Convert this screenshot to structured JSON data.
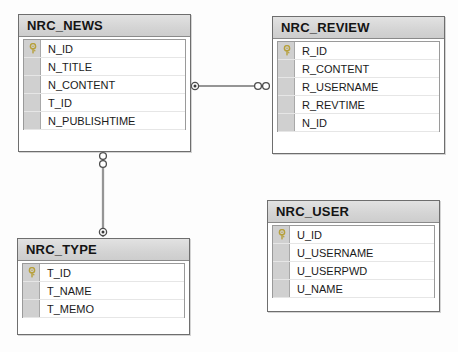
{
  "diagram": {
    "background_color": "#fdfdfd",
    "entity_count": 4,
    "relationship_count": 2
  },
  "style": {
    "header_bg": "#d4d4d4",
    "gutter_bg": "#d0d0d0",
    "border_color": "#6e6e6e",
    "row_bg": "#ffffff",
    "text_color": "#1a1a1a",
    "key_icon_color": "#b7a03c"
  },
  "entities": [
    {
      "name": "NRC_NEWS",
      "x": 18,
      "y": 14,
      "width": 173,
      "height": 138,
      "fields": [
        {
          "name": "N_ID",
          "is_key": true,
          "icon": "key-icon"
        },
        {
          "name": "N_TITLE",
          "is_key": false,
          "icon": ""
        },
        {
          "name": "N_CONTENT",
          "is_key": false,
          "icon": ""
        },
        {
          "name": "T_ID",
          "is_key": false,
          "icon": ""
        },
        {
          "name": "N_PUBLISHTIME",
          "is_key": false,
          "icon": ""
        }
      ]
    },
    {
      "name": "NRC_REVIEW",
      "x": 272,
      "y": 16,
      "width": 173,
      "height": 138,
      "fields": [
        {
          "name": "R_ID",
          "is_key": true,
          "icon": "key-icon"
        },
        {
          "name": "R_CONTENT",
          "is_key": false,
          "icon": ""
        },
        {
          "name": "R_USERNAME",
          "is_key": false,
          "icon": ""
        },
        {
          "name": "R_REVTIME",
          "is_key": false,
          "icon": ""
        },
        {
          "name": "N_ID",
          "is_key": false,
          "icon": ""
        }
      ]
    },
    {
      "name": "NRC_USER",
      "x": 267,
      "y": 200,
      "width": 173,
      "height": 112,
      "fields": [
        {
          "name": "U_ID",
          "is_key": true,
          "icon": "key-icon"
        },
        {
          "name": "U_USERNAME",
          "is_key": false,
          "icon": ""
        },
        {
          "name": "U_USERPWD",
          "is_key": false,
          "icon": ""
        },
        {
          "name": "U_NAME",
          "is_key": false,
          "icon": ""
        }
      ]
    },
    {
      "name": "NRC_TYPE",
      "x": 17,
      "y": 238,
      "width": 173,
      "height": 97,
      "fields": [
        {
          "name": "T_ID",
          "is_key": true,
          "icon": "key-icon"
        },
        {
          "name": "T_NAME",
          "is_key": false,
          "icon": ""
        },
        {
          "name": "T_MEMO",
          "is_key": false,
          "icon": ""
        }
      ]
    }
  ],
  "relationships": [
    {
      "id": "news-review",
      "from_entity": "NRC_NEWS",
      "to_entity": "NRC_REVIEW",
      "orientation": "horizontal",
      "from_marker": "filled-dot",
      "to_marker": "double-circle",
      "x1": 191,
      "y1": 86,
      "x2": 271,
      "y2": 86
    },
    {
      "id": "news-type",
      "from_entity": "NRC_NEWS",
      "to_entity": "NRC_TYPE",
      "orientation": "vertical",
      "from_marker": "double-circle",
      "to_marker": "filled-dot",
      "x1": 103,
      "y1": 152,
      "x2": 103,
      "y2": 238
    }
  ]
}
